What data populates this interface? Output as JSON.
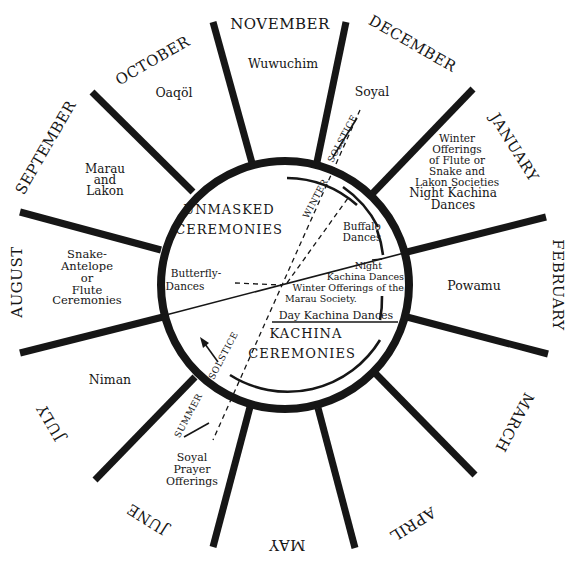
{
  "diagram": {
    "colors": {
      "ink": "#161616",
      "background": "#ffffff"
    },
    "months": [
      {
        "label": "NOVEMBER",
        "ceremony": [
          "Wuwuchim"
        ]
      },
      {
        "label": "DECEMBER",
        "ceremony": [
          "Soyal"
        ]
      },
      {
        "label": "JANUARY",
        "ceremony": [
          "Winter",
          "Offerings",
          "of Flute or",
          "Snake and",
          "Lakon Societies",
          "",
          "Night Kachina",
          "Dances"
        ]
      },
      {
        "label": "FEBRUARY",
        "ceremony": [
          "Powamu"
        ]
      },
      {
        "label": "MARCH",
        "ceremony": []
      },
      {
        "label": "APRIL",
        "ceremony": []
      },
      {
        "label": "MAY",
        "ceremony": []
      },
      {
        "label": "JUNE",
        "ceremony": [
          "Soyal",
          "Prayer",
          "Offerings"
        ]
      },
      {
        "label": "JULY",
        "ceremony": [
          "Niman"
        ]
      },
      {
        "label": "AUGUST",
        "ceremony": [
          "Snake-",
          "Antelope",
          "or",
          "Flute",
          "Ceremonies"
        ]
      },
      {
        "label": "SEPTEMBER",
        "ceremony": [
          "Marau",
          "and",
          "Lakon"
        ]
      },
      {
        "label": "OCTOBER",
        "ceremony": [
          "Oaqöl"
        ]
      }
    ],
    "inner": {
      "unmasked_line1": "UNMASKED",
      "unmasked_line2": "CEREMONIES",
      "kachina_line1": "KACHINA",
      "kachina_line2": "CEREMONIES",
      "butterfly_line1": "Butterfly-",
      "butterfly_line2": "Dances",
      "buffalo_line1": "Buffalo",
      "buffalo_line2": "Dances",
      "night_line1": "Night",
      "night_line2": "Kachina Dances",
      "winter_off_line1": "Winter Offerings of the",
      "winter_off_line2": "Marau Society.",
      "day_kachina": "Day Kachina Dances",
      "winter_label": "WINTER",
      "winter_solstice": "SOLSTICE",
      "summer_solstice": "SOLSTICE",
      "summer_label": "SUMMER"
    }
  }
}
